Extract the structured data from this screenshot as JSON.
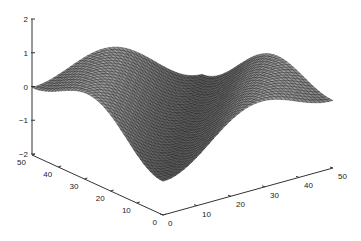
{
  "chart_data": {
    "type": "surface",
    "title": "",
    "xlabel": "",
    "ylabel": "",
    "zlabel": "",
    "function_description": "mesh surface z = sin(pi*x/16) * cos(pi*y/16) style wave over a 50x50 grid, viewed in default 3D perspective",
    "x_range": [
      0,
      50
    ],
    "y_range": [
      0,
      50
    ],
    "z_range": [
      -2,
      2
    ],
    "x_ticks": [
      "0",
      "10",
      "20",
      "30",
      "40",
      "50"
    ],
    "y_ticks": [
      "0",
      "10",
      "20",
      "30",
      "40",
      "50"
    ],
    "z_ticks": [
      "-2",
      "-1",
      "0",
      "1",
      "2"
    ],
    "grid": false,
    "legend": null,
    "surface_style": "black mesh with gray shading",
    "approx_peaks_z": [
      1,
      1,
      1
    ],
    "approx_troughs_z": [
      -1,
      -1
    ]
  },
  "axes": {
    "z_axis": {
      "x": 32,
      "top": 19,
      "bottom": 154
    },
    "origin": {
      "x": 163,
      "y": 215
    },
    "y_axis_end": {
      "x": 32,
      "y": 155
    },
    "x_axis_end": {
      "x": 333,
      "y": 168
    }
  },
  "colors": {
    "axis": "#333333",
    "mesh": "#111111",
    "face": "#9a9a9a",
    "background": "#ffffff"
  }
}
